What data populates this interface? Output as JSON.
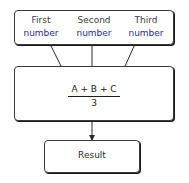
{
  "diagram": {
    "inputs": [
      {
        "line1": "First",
        "line2": "number"
      },
      {
        "line1": "Second",
        "line2": "number"
      },
      {
        "line1": "Third",
        "line2": "number"
      }
    ],
    "formula": {
      "numerator": "A + B + C",
      "denominator": "3"
    },
    "result": "Result",
    "colors": {
      "accent_text": "#2b2b8c",
      "line": "#2a2a2a"
    }
  }
}
